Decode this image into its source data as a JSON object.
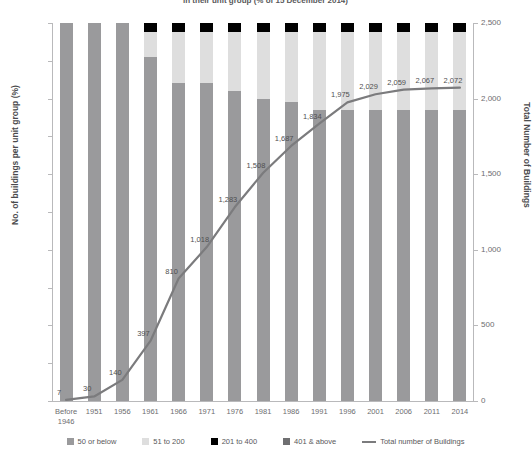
{
  "chart_data": {
    "type": "bar",
    "title": "in their unit group (% of 15 December 2014)",
    "xlabel": "",
    "ylabel": "No. of buildings per unit group (%)",
    "y2label": "Total Number of Buildings",
    "ylim": [
      0,
      100
    ],
    "y2lim": [
      0,
      2500
    ],
    "grid": false,
    "legend_position": "bottom",
    "categories": [
      "Before\n1946",
      "1951",
      "1956",
      "1961",
      "1966",
      "1971",
      "1976",
      "1981",
      "1986",
      "1991",
      "1996",
      "2001",
      "2006",
      "2011",
      "2014"
    ],
    "category_labels": [
      {
        "line1": "Before",
        "line2": "1946"
      },
      {
        "line1": "1951",
        "line2": ""
      },
      {
        "line1": "1956",
        "line2": ""
      },
      {
        "line1": "1961",
        "line2": ""
      },
      {
        "line1": "1966",
        "line2": ""
      },
      {
        "line1": "1971",
        "line2": ""
      },
      {
        "line1": "1976",
        "line2": ""
      },
      {
        "line1": "1981",
        "line2": ""
      },
      {
        "line1": "1986",
        "line2": ""
      },
      {
        "line1": "1991",
        "line2": ""
      },
      {
        "line1": "1996",
        "line2": ""
      },
      {
        "line1": "2001",
        "line2": ""
      },
      {
        "line1": "2006",
        "line2": ""
      },
      {
        "line1": "2011",
        "line2": ""
      },
      {
        "line1": "2014",
        "line2": ""
      }
    ],
    "ytick_labels_left": [
      "100%",
      "90%",
      "80%",
      "70%",
      "60%",
      "50%",
      "40%",
      "30%",
      "20%",
      "10%",
      "0%"
    ],
    "ytick_values_left": [
      100,
      90,
      80,
      70,
      60,
      50,
      40,
      30,
      20,
      10,
      0
    ],
    "ytick_labels_right": [
      "2,500",
      "2,000",
      "1,500",
      "1,000",
      "500",
      "0"
    ],
    "ytick_values_right": [
      2500,
      2000,
      1500,
      1000,
      500,
      0
    ],
    "series": [
      {
        "name": "50 or below",
        "color": "#9a9a9c",
        "values": [
          100,
          100,
          100,
          91,
          84,
          84,
          82,
          80,
          79,
          77,
          77,
          77,
          77,
          77,
          77
        ]
      },
      {
        "name": "51 to 200",
        "color": "#dedede",
        "values": [
          0,
          0,
          0,
          6.5,
          13.5,
          13.5,
          15.5,
          17.5,
          18.5,
          20.5,
          20.5,
          20.5,
          20.5,
          20.5,
          20.5
        ]
      },
      {
        "name": "201 to 400",
        "color": "#000000",
        "values": [
          0,
          0,
          0,
          2.5,
          2.5,
          2.5,
          2.5,
          2.5,
          2.5,
          2.5,
          2.5,
          2.5,
          2.5,
          2.5,
          2.5
        ]
      },
      {
        "name": "401 & above",
        "color": "#6f6f71",
        "values": [
          0,
          0,
          0,
          0,
          0,
          0,
          0,
          0,
          0,
          0,
          0,
          0,
          0,
          0,
          0
        ]
      }
    ],
    "line_series": {
      "name": "Total number of Buildings",
      "color": "#7b7b7d",
      "values": [
        7,
        30,
        140,
        397,
        810,
        1018,
        1283,
        1508,
        1687,
        1834,
        1975,
        2029,
        2059,
        2067,
        2072
      ],
      "labels": [
        "7",
        "30",
        "140",
        "397",
        "810",
        "1,018",
        "1,283",
        "1,508",
        "1,687",
        "1,834",
        "1,975",
        "2,029",
        "2,059",
        "2,067",
        "2,072"
      ]
    },
    "legend": [
      {
        "label": "50 or below",
        "color": "#9a9a9c",
        "marker": "square"
      },
      {
        "label": "51 to 200",
        "color": "#dedede",
        "marker": "square"
      },
      {
        "label": "201 to 400",
        "color": "#000000",
        "marker": "square"
      },
      {
        "label": "401 & above",
        "color": "#6f6f71",
        "marker": "square"
      },
      {
        "label": "Total number of Buildings",
        "color": "#7b7b7d",
        "marker": "line"
      }
    ]
  }
}
